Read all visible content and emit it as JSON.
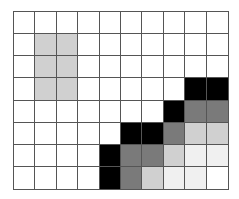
{
  "grid": {
    "rows": 8,
    "cols": 10,
    "colors": {
      "0": "#ffffff",
      "1": "#f0f0f0",
      "2": "#d0d0d0",
      "3": "#7a7a7a",
      "4": "#000000"
    },
    "cells": [
      [
        0,
        0,
        0,
        0,
        0,
        0,
        0,
        0,
        0,
        0
      ],
      [
        0,
        2,
        2,
        0,
        0,
        0,
        0,
        0,
        0,
        0
      ],
      [
        0,
        2,
        2,
        0,
        0,
        0,
        0,
        0,
        0,
        0
      ],
      [
        0,
        2,
        2,
        0,
        0,
        0,
        0,
        0,
        4,
        4
      ],
      [
        0,
        0,
        0,
        0,
        0,
        0,
        0,
        4,
        3,
        3
      ],
      [
        0,
        0,
        0,
        0,
        0,
        4,
        4,
        3,
        2,
        2
      ],
      [
        0,
        0,
        0,
        0,
        4,
        3,
        3,
        2,
        1,
        1
      ],
      [
        0,
        0,
        0,
        0,
        4,
        3,
        2,
        1,
        1,
        0
      ]
    ]
  }
}
